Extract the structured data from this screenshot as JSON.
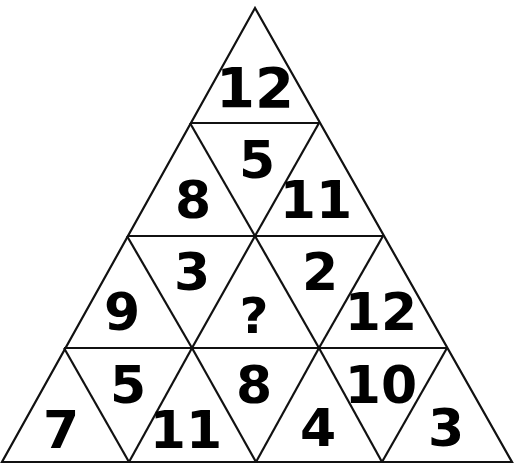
{
  "puzzle": {
    "type": "number-triangle-pyramid",
    "rows": 4,
    "cells": [
      {
        "id": "r1-up1",
        "value": "12",
        "x": 255,
        "y": 107,
        "size": 56
      },
      {
        "id": "r2-up1",
        "value": "8",
        "x": 193,
        "y": 218,
        "size": 52
      },
      {
        "id": "r2-down1",
        "value": "5",
        "x": 257,
        "y": 178,
        "size": 52
      },
      {
        "id": "r2-up2",
        "value": "11",
        "x": 316,
        "y": 218,
        "size": 52
      },
      {
        "id": "r3-up1",
        "value": "9",
        "x": 122,
        "y": 330,
        "size": 52
      },
      {
        "id": "r3-down1",
        "value": "3",
        "x": 192,
        "y": 290,
        "size": 52
      },
      {
        "id": "r3-up2",
        "value": "?",
        "x": 254,
        "y": 333,
        "size": 50
      },
      {
        "id": "r3-down2",
        "value": "2",
        "x": 320,
        "y": 290,
        "size": 52
      },
      {
        "id": "r3-up3",
        "value": "12",
        "x": 381,
        "y": 330,
        "size": 52
      },
      {
        "id": "r4-up1",
        "value": "7",
        "x": 61,
        "y": 448,
        "size": 52
      },
      {
        "id": "r4-down1",
        "value": "5",
        "x": 128,
        "y": 403,
        "size": 52
      },
      {
        "id": "r4-up2",
        "value": "11",
        "x": 186,
        "y": 448,
        "size": 52
      },
      {
        "id": "r4-down2",
        "value": "8",
        "x": 254,
        "y": 403,
        "size": 52
      },
      {
        "id": "r4-up3",
        "value": "4",
        "x": 318,
        "y": 446,
        "size": 52
      },
      {
        "id": "r4-down3",
        "value": "10",
        "x": 381,
        "y": 403,
        "size": 52
      },
      {
        "id": "r4-up4",
        "value": "3",
        "x": 446,
        "y": 446,
        "size": 52
      }
    ],
    "unknown_symbol": "?"
  }
}
